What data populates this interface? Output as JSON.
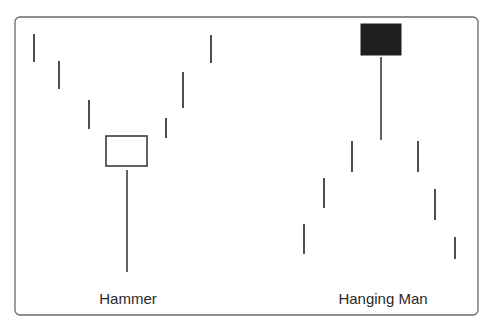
{
  "chart_data": {
    "type": "diagram",
    "title": "",
    "frame": {
      "x": 15,
      "y": 17,
      "width": 463,
      "height": 298,
      "radius": 5
    },
    "patterns": [
      {
        "name": "Hammer",
        "label": "Hammer",
        "label_pos": {
          "x": 128,
          "y": 290
        },
        "trend": "downtrend then reversal",
        "sticks": [
          {
            "x": 34,
            "y1": 34,
            "y2": 62
          },
          {
            "x": 59,
            "y1": 61,
            "y2": 89
          },
          {
            "x": 89,
            "y1": 100,
            "y2": 129
          },
          {
            "x": 166,
            "y1": 118,
            "y2": 138
          },
          {
            "x": 183,
            "y1": 72,
            "y2": 108
          },
          {
            "x": 211,
            "y1": 35,
            "y2": 63
          }
        ],
        "candle": {
          "body": {
            "x": 106,
            "y": 136,
            "width": 41,
            "height": 30,
            "fill": "hollow"
          },
          "wick": {
            "x": 127,
            "y1": 170,
            "y2": 272
          }
        }
      },
      {
        "name": "Hanging Man",
        "label": "Hanging Man",
        "label_pos": {
          "x": 383,
          "y": 290
        },
        "trend": "uptrend then reversal",
        "sticks": [
          {
            "x": 304,
            "y1": 224,
            "y2": 254
          },
          {
            "x": 324,
            "y1": 178,
            "y2": 208
          },
          {
            "x": 352,
            "y1": 141,
            "y2": 172
          },
          {
            "x": 418,
            "y1": 141,
            "y2": 172
          },
          {
            "x": 435,
            "y1": 189,
            "y2": 220
          },
          {
            "x": 455,
            "y1": 237,
            "y2": 259
          }
        ],
        "candle": {
          "body": {
            "x": 361,
            "y": 24,
            "width": 40,
            "height": 31,
            "fill": "filled"
          },
          "wick": {
            "x": 381,
            "y1": 57,
            "y2": 140
          }
        }
      }
    ],
    "colors": {
      "line": "#3a3a3a",
      "frame": "#6a6a6a",
      "filled_body": "#1e1e1e",
      "background": "#ffffff"
    }
  },
  "labels": {
    "hammer": "Hammer",
    "hanging_man": "Hanging Man"
  }
}
